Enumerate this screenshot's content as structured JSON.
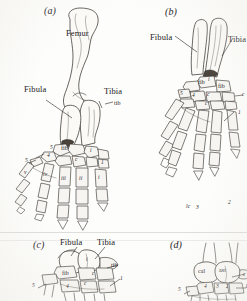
{
  "figure": {
    "kind": "anatomical-plate",
    "background_hex": "#fdfdfb",
    "ink_hex": "#23201d",
    "panel_count": 4
  },
  "panels": [
    {
      "id": "a",
      "id_label": "(a)",
      "labels": {
        "femur": "Femur",
        "fibula": "Fibula",
        "tibia": "Tibia",
        "fib": "fib",
        "tib": "tib",
        "tib_right": "tib",
        "i": "i",
        "c": "c",
        "five": "5",
        "four": "4",
        "one": "1",
        "two": "2",
        "three": "3",
        "roman_i": "i",
        "roman_ii": "ii",
        "roman_iii": "iii",
        "roman_iv": "iv",
        "roman_v": "v"
      }
    },
    {
      "id": "b",
      "id_label": "(b)",
      "labels": {
        "fibula": "Fibula",
        "tibia": "Tibia",
        "fib_left": "fib",
        "fib_right": "fib",
        "i": "i",
        "c_upper": "c",
        "c_lower": "c",
        "c_right": "c",
        "four": "4",
        "five": "5",
        "three": "3",
        "two": "2",
        "one": "1",
        "lc": "lc"
      }
    },
    {
      "id": "c",
      "id_label": "(c)",
      "labels": {
        "fibula": "Fibula",
        "tibia": "Tibia",
        "fib": "fib",
        "tib": "tib",
        "i": "i",
        "c_upper": "c",
        "c_lower": "c",
        "five": "5",
        "four": "4",
        "one": "1"
      }
    },
    {
      "id": "d",
      "id_label": "(d)",
      "labels": {
        "cal": "cal",
        "ast": "ast",
        "c": "c",
        "five": "5",
        "four": "4",
        "three": "3",
        "two": "2",
        "one": "1"
      }
    }
  ]
}
